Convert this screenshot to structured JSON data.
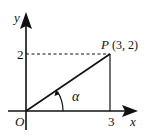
{
  "diagram": {
    "type": "coordinate-plane",
    "axes": {
      "x_label": "x",
      "y_label": "y",
      "origin_label": "O"
    },
    "ticks": {
      "x_tick": "3",
      "y_tick": "2"
    },
    "point": {
      "name": "P",
      "coords": "(3, 2)",
      "x": 3,
      "y": 2
    },
    "angle": {
      "symbol": "α"
    },
    "colors": {
      "stroke": "#111111",
      "background": "#ffffff"
    }
  }
}
